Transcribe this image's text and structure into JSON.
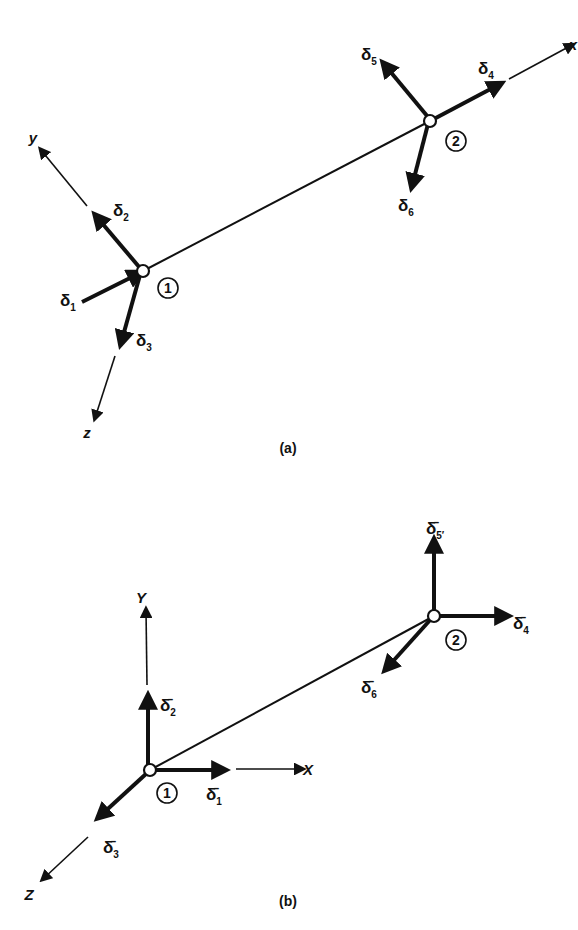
{
  "figure_a": {
    "caption": "(a)",
    "member": {
      "from": [
        143,
        271
      ],
      "to": [
        430,
        121
      ]
    },
    "nodes": [
      {
        "id": "1",
        "x": 143,
        "y": 271,
        "label": "1",
        "label_x": 168,
        "label_y": 288
      },
      {
        "id": "2",
        "x": 430,
        "y": 121,
        "label": "2",
        "label_x": 456,
        "label_y": 141
      }
    ],
    "axes": [
      {
        "name": "y",
        "label": "y",
        "from": [
          87,
          206
        ],
        "to": [
          41,
          150
        ],
        "label_x": 33,
        "label_y": 143
      },
      {
        "name": "z",
        "label": "z",
        "from": [
          115,
          356
        ],
        "to": [
          95,
          418
        ],
        "label_x": 87,
        "label_y": 438
      },
      {
        "name": "x",
        "label": "x",
        "from": [
          509,
          79
        ],
        "to": [
          572,
          45
        ],
        "label_x": 573,
        "label_y": 50
      }
    ],
    "dofs": [
      {
        "name": "delta1",
        "symbol": "δ",
        "sub": "1",
        "from": [
          82,
          302
        ],
        "to": [
          140,
          273
        ],
        "label_x": 60,
        "label_y": 306
      },
      {
        "name": "delta2",
        "symbol": "δ",
        "sub": "2",
        "from": [
          140,
          268
        ],
        "to": [
          96,
          216
        ],
        "label_x": 113,
        "label_y": 216
      },
      {
        "name": "delta3",
        "symbol": "δ",
        "sub": "3",
        "from": [
          140,
          275
        ],
        "to": [
          121,
          343
        ],
        "label_x": 136,
        "label_y": 346
      },
      {
        "name": "delta4",
        "symbol": "δ",
        "sub": "4",
        "from": [
          432,
          120
        ],
        "to": [
          500,
          84
        ],
        "label_x": 478,
        "label_y": 74
      },
      {
        "name": "delta5",
        "symbol": "δ",
        "sub": "5",
        "from": [
          428,
          117
        ],
        "to": [
          384,
          64
        ],
        "label_x": 361,
        "label_y": 60
      },
      {
        "name": "delta6",
        "symbol": "δ",
        "sub": "6",
        "from": [
          428,
          124
        ],
        "to": [
          412,
          186
        ],
        "label_x": 398,
        "label_y": 211
      }
    ]
  },
  "figure_b": {
    "caption": "(b)",
    "member": {
      "from": [
        150,
        770
      ],
      "to": [
        434,
        616
      ]
    },
    "nodes": [
      {
        "id": "1",
        "x": 150,
        "y": 770,
        "label": "1",
        "label_x": 167,
        "label_y": 793
      },
      {
        "id": "2",
        "x": 434,
        "y": 616,
        "label": "2",
        "label_x": 456,
        "label_y": 640
      }
    ],
    "axes": [
      {
        "name": "Y",
        "label": "Y",
        "from": [
          147,
          685
        ],
        "to": [
          146,
          610
        ],
        "label_x": 141,
        "label_y": 603
      },
      {
        "name": "X",
        "label": "X",
        "from": [
          236,
          769
        ],
        "to": [
          302,
          769
        ],
        "label_x": 308,
        "label_y": 775
      },
      {
        "name": "Z",
        "label": "Z",
        "from": [
          88,
          837
        ],
        "to": [
          43,
          879
        ],
        "label_x": 29,
        "label_y": 900
      }
    ],
    "dofs": [
      {
        "name": "delta1bar",
        "symbol": "δ̄",
        "sub": "1",
        "from": [
          153,
          770
        ],
        "to": [
          224,
          770
        ],
        "label_x": 206,
        "label_y": 800
      },
      {
        "name": "delta2bar",
        "symbol": "δ̄",
        "sub": "2",
        "from": [
          148,
          766
        ],
        "to": [
          148,
          697
        ],
        "label_x": 160,
        "label_y": 711
      },
      {
        "name": "delta3bar",
        "symbol": "δ̄",
        "sub": "3",
        "from": [
          147,
          773
        ],
        "to": [
          99,
          817
        ],
        "label_x": 103,
        "label_y": 853
      },
      {
        "name": "delta4bar",
        "symbol": "δ̄",
        "sub": "4",
        "from": [
          437,
          616
        ],
        "to": [
          507,
          616
        ],
        "label_x": 513,
        "label_y": 629
      },
      {
        "name": "delta5bar",
        "symbol": "δ̄",
        "sub": "5′",
        "from": [
          434,
          612
        ],
        "to": [
          434,
          541
        ],
        "label_x": 426,
        "label_y": 534
      },
      {
        "name": "delta6bar",
        "symbol": "δ̄",
        "sub": "6",
        "from": [
          431,
          619
        ],
        "to": [
          386,
          669
        ],
        "label_x": 361,
        "label_y": 693
      }
    ]
  },
  "colors": {
    "ink": "#111111",
    "background": "#ffffff"
  }
}
